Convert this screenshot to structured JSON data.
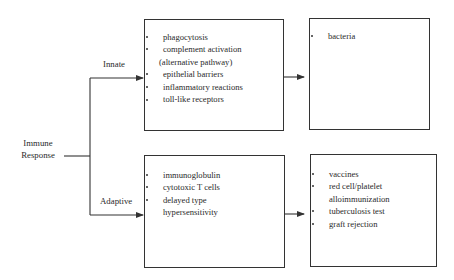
{
  "diagram": {
    "root": {
      "label_line1": "Immune",
      "label_line2": "Response"
    },
    "branches": {
      "innate": {
        "label": "Innate",
        "mechanisms": [
          {
            "text": "phagocytosis"
          },
          {
            "text": "complement activation",
            "continuation": "(alternative pathway)"
          },
          {
            "text": "epithelial barriers"
          },
          {
            "text": "inflammatory reactions"
          },
          {
            "text": "toll-like receptors"
          }
        ],
        "examples": [
          {
            "text": "bacteria"
          }
        ]
      },
      "adaptive": {
        "label": "Adaptive",
        "mechanisms": [
          {
            "text": "immunoglobulin"
          },
          {
            "text": "cytotoxic T cells"
          },
          {
            "text": "delayed type",
            "continuation": "hypersensitivity"
          }
        ],
        "examples": [
          {
            "text": "vaccines"
          },
          {
            "text": "red cell/platelet",
            "continuation": "alloimmunization"
          },
          {
            "text": "tuberculosis test"
          },
          {
            "text": "graft rejection"
          }
        ]
      }
    },
    "colors": {
      "line": "#333333",
      "text": "#2a2a2a",
      "background": "#ffffff"
    }
  }
}
